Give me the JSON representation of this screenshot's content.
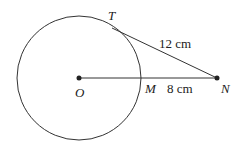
{
  "diagram": {
    "type": "geometry",
    "points": {
      "O": {
        "label": "O"
      },
      "M": {
        "label": "M"
      },
      "N": {
        "label": "N"
      },
      "T": {
        "label": "T"
      }
    },
    "measurements": {
      "TN": "12 cm",
      "MN": "8 cm"
    },
    "colors": {
      "stroke": "#333333",
      "text": "#222222"
    }
  }
}
